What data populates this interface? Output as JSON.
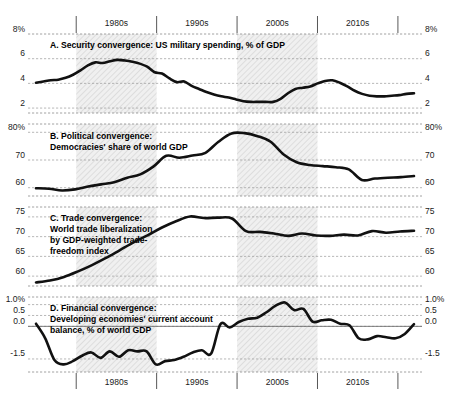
{
  "figure": {
    "background": "#ffffff",
    "line_color": "#111111",
    "band_color": "#ebebeb",
    "grid_color": "#8c8c8c",
    "zero_line_color": "#6e6e6e"
  },
  "decades": {
    "top_labels": [
      "1980s",
      "1990s",
      "2000s",
      "2010s"
    ],
    "bottom_labels": [
      "1980s",
      "1990s",
      "2000s",
      "2010s"
    ]
  },
  "chart_data": [
    {
      "type": "line",
      "panel": "A",
      "title": "A. Security convergence: US military spending, % of GDP",
      "title_lines": [
        "A. Security convergence: US military spending, % of GDP"
      ],
      "xlabel": "",
      "ylabel": "",
      "ylim": [
        1.6,
        8.0
      ],
      "yticks": [
        8,
        6,
        4,
        2
      ],
      "ytick_labels": [
        "8%",
        "6",
        "4",
        "2"
      ],
      "ytick_labels_right": [
        "8%",
        "6",
        "4",
        "2"
      ],
      "grid": true,
      "legend": "none",
      "x": [
        1975,
        1976,
        1977,
        1978,
        1979,
        1980,
        1981,
        1982,
        1983,
        1984,
        1985,
        1986,
        1987,
        1988,
        1989,
        1990,
        1991,
        1992,
        1993,
        1994,
        1995,
        1996,
        1997,
        1998,
        1999,
        2000,
        2001,
        2002,
        2003,
        2004,
        2005,
        2006,
        2007,
        2008,
        2009,
        2010,
        2011,
        2012,
        2013,
        2014,
        2015,
        2016,
        2017,
        2018,
        2019,
        2020,
        2021,
        2022
      ],
      "values": [
        4.05,
        4.15,
        4.25,
        4.3,
        4.45,
        4.7,
        5.05,
        5.45,
        5.7,
        5.65,
        5.8,
        5.9,
        5.85,
        5.75,
        5.6,
        5.35,
        4.9,
        4.8,
        4.4,
        4.1,
        4.15,
        3.8,
        3.55,
        3.3,
        3.1,
        2.95,
        2.85,
        2.7,
        2.55,
        2.5,
        2.5,
        2.5,
        2.5,
        2.75,
        3.2,
        3.55,
        3.65,
        3.75,
        4.0,
        4.2,
        4.25,
        4.05,
        3.75,
        3.4,
        3.15,
        3.0,
        2.95,
        2.95,
        3.0,
        3.05,
        3.15,
        3.2
      ]
    },
    {
      "type": "line",
      "panel": "B",
      "title": "B. Political convergence: Democracies' share of world GDP",
      "title_lines": [
        "B. Political convergence:",
        "Democracies' share of world GDP"
      ],
      "xlabel": "",
      "ylabel": "",
      "ylim": [
        57.0,
        83.0
      ],
      "yticks": [
        80,
        70,
        60
      ],
      "ytick_labels": [
        "80%",
        "70",
        "60"
      ],
      "ytick_labels_right": [
        "80%",
        "70",
        "60"
      ],
      "grid": true,
      "legend": "none",
      "x": [
        1975,
        1977,
        1979,
        1981,
        1983,
        1985,
        1987,
        1989,
        1991,
        1993,
        1995,
        1997,
        1999,
        2001,
        2003,
        2005,
        2007,
        2009,
        2011,
        2013,
        2015,
        2017,
        2019,
        2021,
        2022
      ],
      "values": [
        59.8,
        59.6,
        59.0,
        59.4,
        60.4,
        61.2,
        62.0,
        63.6,
        64.8,
        67.6,
        71.5,
        70.8,
        71.6,
        72.6,
        76.6,
        79.6,
        79.7,
        78.6,
        76.6,
        72.0,
        69.2,
        68.2,
        67.8,
        67.4,
        66.6,
        62.8,
        63.3,
        63.6,
        63.8,
        64.2
      ]
    },
    {
      "type": "line",
      "panel": "C",
      "title": "C. Trade convergence: World trade liberalization by GDP-weighted trade-freedom index",
      "title_lines": [
        "C. Trade convergence:",
        "World trade liberalization",
        "by GDP-weighted trade-",
        "freedom index"
      ],
      "xlabel": "",
      "ylabel": "",
      "ylim": [
        57.5,
        77.5
      ],
      "yticks": [
        75,
        70,
        65,
        60
      ],
      "ytick_labels": [
        "75",
        "70",
        "65",
        "60"
      ],
      "ytick_labels_right": [
        "75",
        "70",
        "65",
        "60"
      ],
      "grid": true,
      "legend": "none",
      "x": [
        1975,
        1978,
        1981,
        1984,
        1987,
        1990,
        1993,
        1996,
        1999,
        2002,
        2005,
        2008,
        2011,
        2014,
        2017,
        2020,
        2022
      ],
      "values": [
        58.4,
        58.9,
        59.8,
        61.2,
        62.8,
        64.6,
        66.6,
        68.6,
        70.4,
        72.3,
        73.9,
        75.1,
        74.7,
        74.8,
        74.6,
        71.4,
        71.2,
        70.8,
        70.2,
        70.8,
        70.3,
        70.2,
        70.5,
        70.3,
        71.4,
        71.0,
        71.3,
        71.5
      ]
    },
    {
      "type": "line",
      "panel": "D",
      "title": "D. Financial convergence: Developing economies' current account balance, % of world GDP",
      "title_lines": [
        "D. Financial convergence:",
        "Developing economies' current account",
        "balance, % of world GDP"
      ],
      "xlabel": "",
      "ylabel": "",
      "ylim": [
        -2.1,
        1.35
      ],
      "yticks": [
        1.0,
        0.5,
        0.0,
        -1.5
      ],
      "ytick_labels": [
        "1.0%",
        "0.5",
        "0.0",
        "-1.5"
      ],
      "ytick_labels_right": [
        "1.0%",
        "0.5",
        "0.0",
        "-1.5"
      ],
      "grid": true,
      "zero_line": 0.0,
      "legend": "none",
      "x": [
        1975,
        1977,
        1979,
        1981,
        1983,
        1985,
        1987,
        1989,
        1991,
        1993,
        1995,
        1997,
        1999,
        2001,
        2003,
        2005,
        2007,
        2009,
        2011,
        2013,
        2015,
        2017,
        2019,
        2021,
        2022
      ],
      "values": [
        0.12,
        -0.55,
        -1.55,
        -1.75,
        -1.6,
        -1.35,
        -1.2,
        -1.45,
        -1.15,
        -1.4,
        -1.1,
        -1.15,
        -1.15,
        -1.75,
        -1.6,
        -1.55,
        -1.4,
        -1.2,
        -1.1,
        -1.25,
        0.1,
        -0.05,
        0.2,
        0.35,
        0.4,
        0.65,
        0.95,
        1.1,
        0.75,
        0.8,
        0.22,
        0.28,
        0.3,
        0.12,
        0.05,
        -0.55,
        -0.6,
        -0.45,
        -0.5,
        -0.55,
        -0.35,
        0.1
      ]
    }
  ]
}
